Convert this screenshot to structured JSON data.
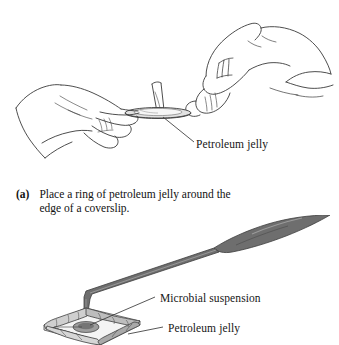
{
  "figure": {
    "background_color": "#ffffff",
    "ink_color": "#2a2a2a",
    "shade_color": "#6b6b6b",
    "light_shade_color": "#b4b4b4"
  },
  "panel_a": {
    "id": "a",
    "marker": "(a)",
    "caption": "Place a ring of petroleum jelly around the edge of a coverslip.",
    "labels": [
      {
        "name": "petroleum-jelly",
        "text": "Petroleum jelly"
      }
    ],
    "scene": {
      "left_hand": "hand holding coverslip between thumb and fingers",
      "right_hand": "hand holding applicator stick applying jelly",
      "object": "square coverslip with petroleum jelly ring"
    }
  },
  "panel_b": {
    "labels": [
      {
        "name": "microbial-suspension",
        "text": "Microbial suspension"
      },
      {
        "name": "petroleum-jelly",
        "text": "Petroleum jelly"
      }
    ],
    "scene": {
      "pipette": "dropper pipette with gray bulb and bent thin tube tip",
      "object": "coverslip with petroleum jelly ring and drop of suspension in center"
    }
  }
}
